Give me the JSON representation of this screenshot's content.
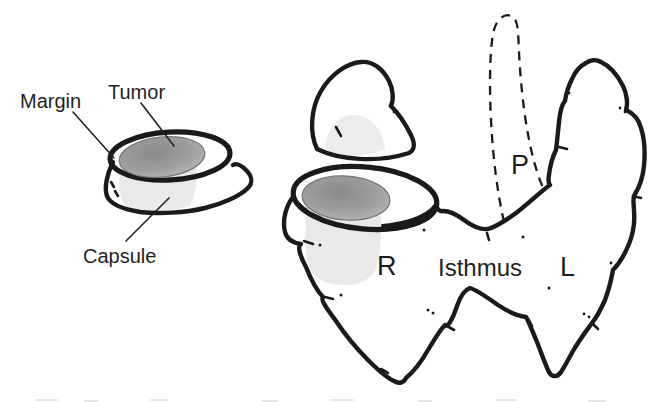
{
  "diagram": {
    "specimen": {
      "margin_label": "Margin",
      "tumor_label": "Tumor",
      "capsule_label": "Capsule"
    },
    "thyroid": {
      "pyramidal_lobe_label": "P",
      "right_lobe_label": "R",
      "isthmus_label": "Isthmus",
      "left_lobe_label": "L"
    },
    "colors": {
      "outline": "#1a1a1a",
      "label_text": "#1f1f1f",
      "tumor_dark": "#8a8a8a",
      "tumor_mid": "#9d9d9d",
      "tumor_light": "#bcbcbc",
      "tumor_edge": "#777777",
      "tissue_shadow": "#e9e9e9",
      "cut_face_shadow": "#ececec",
      "background": "#ffffff"
    }
  }
}
